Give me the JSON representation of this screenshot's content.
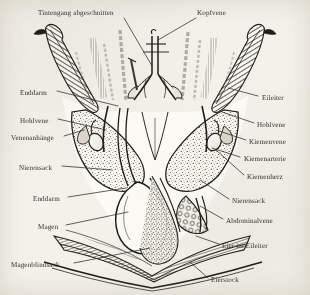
{
  "figure": {
    "background_color": "#f3f1ea",
    "ink_color": "#2b2a26",
    "language": "de"
  },
  "labels": {
    "top": [
      {
        "id": "tintengang",
        "text": "Tintengang abgeschnitten",
        "align": "left",
        "x": 38,
        "y": 10
      },
      {
        "id": "kopfvene",
        "text": "Kopfvene",
        "align": "left",
        "x": 197,
        "y": 10
      }
    ],
    "left": [
      {
        "id": "enddarm-oben",
        "text": "Enddarm",
        "x": 20,
        "y": 90
      },
      {
        "id": "hohlvene-links",
        "text": "Hohlvene",
        "x": 20,
        "y": 118
      },
      {
        "id": "venenanhaenge",
        "text": "Venenanhänge",
        "x": 11,
        "y": 135
      },
      {
        "id": "nierensack-links",
        "text": "Nierensack",
        "x": 19,
        "y": 165
      },
      {
        "id": "enddarm-unten",
        "text": "Enddarm",
        "x": 33,
        "y": 196
      },
      {
        "id": "magen",
        "text": "Magen",
        "x": 38,
        "y": 224
      },
      {
        "id": "magenblindsack",
        "text": "Magenblindsack",
        "x": 11,
        "y": 262
      }
    ],
    "right": [
      {
        "id": "eileiter",
        "text": "Eileiter",
        "x": 262,
        "y": 95
      },
      {
        "id": "hohlvene-rechts",
        "text": "Hohlvene",
        "x": 257,
        "y": 122
      },
      {
        "id": "kiemenvene",
        "text": "Kiemenvene",
        "x": 249,
        "y": 139
      },
      {
        "id": "kiemenarterie",
        "text": "Kiemenarterie",
        "x": 244,
        "y": 156
      },
      {
        "id": "kiemenherz",
        "text": "Kiemenherz",
        "x": 247,
        "y": 174
      },
      {
        "id": "nierensack-rechts",
        "text": "Nierensack",
        "x": 232,
        "y": 198
      },
      {
        "id": "abdominalvene",
        "text": "Abdominalvene",
        "x": 226,
        "y": 218
      },
      {
        "id": "eier-im-eileiter",
        "text": "Eier im Eileiter",
        "x": 222,
        "y": 243
      },
      {
        "id": "eierstock",
        "text": "Eierstock",
        "x": 211,
        "y": 277
      }
    ]
  }
}
